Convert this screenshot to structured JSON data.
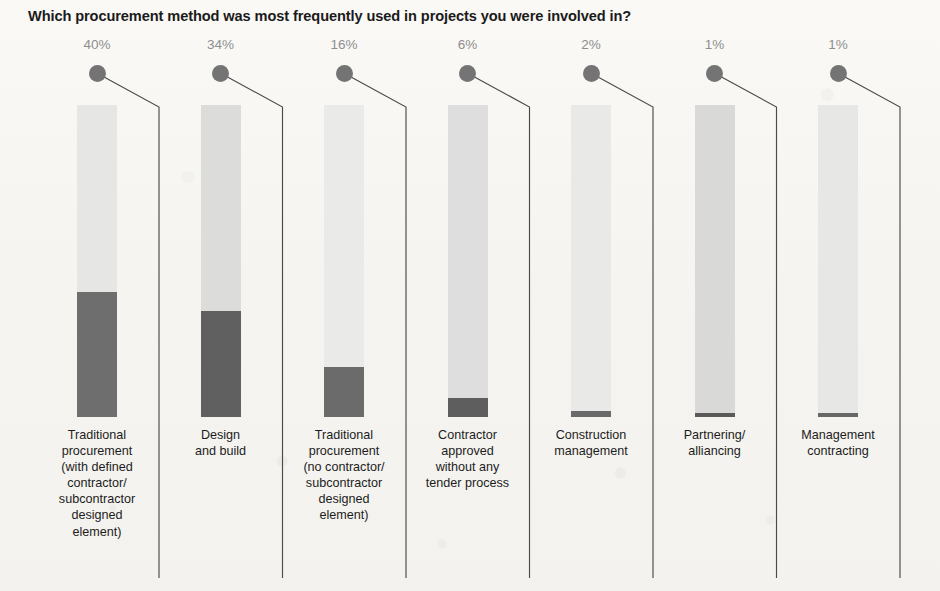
{
  "title": "Which procurement method was most frequently used in projects you were involved in?",
  "colors": {
    "background": "#f5f4f1",
    "title_text": "#1b1b1b",
    "percent_text": "#8e8e8e",
    "track": "#e3e3e1",
    "fill": "#6d6d6d",
    "marker": "#747474",
    "divider": "#4a4a4a",
    "category_text": "#1c1c1c"
  },
  "chart_data": {
    "type": "bar",
    "title": "Which procurement method was most frequently used in projects you were involved in?",
    "subtitle": "",
    "xlabel": "",
    "ylabel": "",
    "ylim": [
      0,
      100
    ],
    "grid": false,
    "legend": "none",
    "orientation": "vertical",
    "style": "thermometer-fill",
    "categories": [
      "Traditional procurement (with defined contractor/ subcontractor designed element)",
      "Design and build",
      "Traditional procurement (no contractor/ subcontractor designed element)",
      "Contractor approved without any tender process",
      "Construction management",
      "Partnering/ alliancing",
      "Management contracting"
    ],
    "values": [
      40,
      34,
      16,
      6,
      2,
      1,
      1
    ],
    "value_labels": [
      "40%",
      "34%",
      "16%",
      "6%",
      "2%",
      "1%",
      "1%"
    ],
    "unit": "%"
  },
  "bars": [
    {
      "value_label": "40%",
      "label_lines": [
        "Traditional",
        "procurement",
        "(with defined",
        "contractor/",
        "subcontractor",
        "designed",
        "element)"
      ],
      "track_shade": "#e6e6e4",
      "fill_shade": "#6e6e6e"
    },
    {
      "value_label": "34%",
      "label_lines": [
        "Design",
        "and build"
      ],
      "track_shade": "#dcdcda",
      "fill_shade": "#606060"
    },
    {
      "value_label": "16%",
      "label_lines": [
        "Traditional",
        "procurement",
        "(no contractor/",
        "subcontractor",
        "designed",
        "element)"
      ],
      "track_shade": "#eaeae8",
      "fill_shade": "#6b6b6b"
    },
    {
      "value_label": "6%",
      "label_lines": [
        "Contractor",
        "approved",
        "without any",
        "tender process"
      ],
      "track_shade": "#dedede",
      "fill_shade": "#5e5e5e"
    },
    {
      "value_label": "2%",
      "label_lines": [
        "Construction",
        "management"
      ],
      "track_shade": "#e9e9e7",
      "fill_shade": "#6a6a6a"
    },
    {
      "value_label": "1%",
      "label_lines": [
        "Partnering/",
        "alliancing"
      ],
      "track_shade": "#d9d9d7",
      "fill_shade": "#5a5a5a"
    },
    {
      "value_label": "1%",
      "label_lines": [
        "Management",
        "contracting"
      ],
      "track_shade": "#e7e7e5",
      "fill_shade": "#676767"
    }
  ]
}
